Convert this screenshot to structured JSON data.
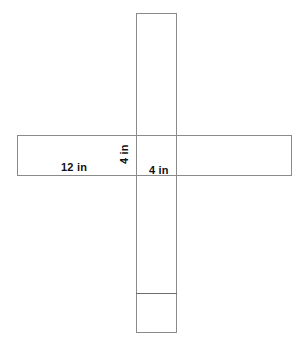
{
  "figure": {
    "kind": "geometric-net-diagram",
    "background_color": "#ffffff",
    "stroke_color": "#8a8a8a",
    "fold_line_color": "#6e6e6e",
    "label_color": "#111111"
  },
  "shapes": {
    "vertical_strip": {
      "name": "vertical-strip",
      "x": 136,
      "y": 13,
      "width": 41,
      "height": 320
    },
    "horizontal_strip": {
      "name": "horizontal-strip",
      "x": 17,
      "y": 135,
      "width": 275,
      "height": 41
    },
    "fold_line": {
      "name": "flap-fold-line",
      "x": 136,
      "y": 293,
      "width": 41
    }
  },
  "labels": {
    "width": {
      "text": "12 in",
      "value": 12,
      "unit": "in",
      "orientation": "horizontal"
    },
    "height": {
      "text": "4 in",
      "value": 4,
      "unit": "in",
      "orientation": "vertical-rotated"
    },
    "depth": {
      "text": "4 in",
      "value": 4,
      "unit": "in",
      "orientation": "horizontal"
    }
  }
}
